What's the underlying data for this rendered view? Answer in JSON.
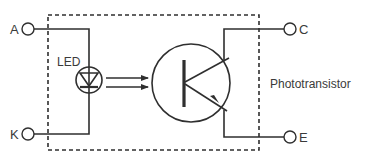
{
  "diagram": {
    "type": "optocoupler-circuit",
    "terminals": {
      "anode": "A",
      "cathode": "K",
      "collector": "C",
      "emitter": "E"
    },
    "components": {
      "led_label": "LED",
      "phototransistor_label": "Phototransistor"
    },
    "colors": {
      "line": "#2f2f2f",
      "text": "#3a3a3a",
      "background": "#ffffff"
    }
  }
}
